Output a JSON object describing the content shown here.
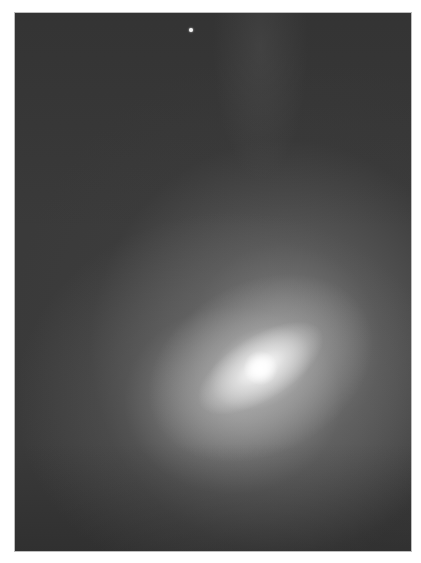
{
  "image": {
    "description": "Grayscale astronomical photograph of a diffuse comet-like object with a bright elongated core",
    "background_color": "#ffffff",
    "frame_background": "#3a3a3a",
    "core_color": "#ffffff"
  }
}
